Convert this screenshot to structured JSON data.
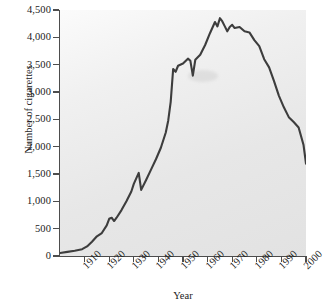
{
  "chart_data": {
    "type": "line",
    "title": "",
    "xlabel": "Year",
    "ylabel": "Number of cigarettes",
    "xlim": [
      1900,
      2000
    ],
    "ylim": [
      0,
      4500
    ],
    "grid": false,
    "legend": null,
    "y_ticks": [
      0,
      500,
      1000,
      1500,
      2000,
      2500,
      3000,
      3500,
      4000,
      4500
    ],
    "y_tick_labels": [
      "0",
      "500",
      "1,000",
      "1,500",
      "2,000",
      "2,500",
      "3,000",
      "3,500",
      "4,000",
      "4,500"
    ],
    "x_ticks": [
      1910,
      1920,
      1930,
      1940,
      1950,
      1960,
      1970,
      1980,
      1990,
      2000
    ],
    "x_tick_labels": [
      "1910",
      "1920",
      "1930",
      "1940",
      "1950",
      "1960",
      "1970",
      "1980",
      "1990",
      "2000"
    ],
    "series": [
      {
        "name": "Number of cigarettes",
        "x": [
          1900,
          1903,
          1906,
          1909,
          1911,
          1913,
          1915,
          1917,
          1919,
          1920,
          1921,
          1922,
          1923,
          1925,
          1927,
          1929,
          1930,
          1931,
          1932,
          1933,
          1935,
          1937,
          1939,
          1941,
          1943,
          1944,
          1945,
          1946,
          1947,
          1948,
          1950,
          1952,
          1953,
          1954,
          1955,
          1957,
          1959,
          1961,
          1963,
          1964,
          1965,
          1966,
          1967,
          1968,
          1969,
          1970,
          1971,
          1973,
          1975,
          1977,
          1979,
          1981,
          1983,
          1985,
          1987,
          1989,
          1991,
          1993,
          1995,
          1997,
          1999,
          2000
        ],
        "y": [
          55,
          75,
          95,
          125,
          175,
          260,
          360,
          420,
          560,
          680,
          700,
          640,
          700,
          840,
          1000,
          1180,
          1320,
          1420,
          1520,
          1210,
          1390,
          1580,
          1770,
          1980,
          2260,
          2480,
          2820,
          3420,
          3370,
          3480,
          3520,
          3610,
          3570,
          3300,
          3590,
          3680,
          3860,
          4080,
          4280,
          4200,
          4350,
          4290,
          4200,
          4110,
          4190,
          4230,
          4170,
          4190,
          4110,
          4090,
          3950,
          3840,
          3600,
          3450,
          3200,
          2930,
          2720,
          2540,
          2450,
          2350,
          2030,
          1690
        ]
      }
    ],
    "line_color": "#3d3d3d",
    "annotation": "Per capita cigarette consumption rises from near zero in 1900 to a peak of roughly 4,350 in the mid-1960s, then declines steadily to about 1,700 by 2000."
  },
  "axes": {
    "y_title": "Number of cigarettes",
    "x_title": "Year"
  }
}
